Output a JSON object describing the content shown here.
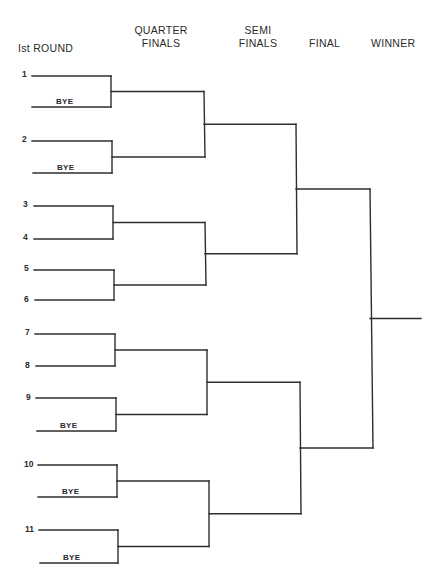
{
  "headers": {
    "round1": "Ist ROUND",
    "quarter_line1": "QUARTER",
    "quarter_line2": "FINALS",
    "semi_line1": "SEMI",
    "semi_line2": "FINALS",
    "final": "FINAL",
    "winner": "WINNER"
  },
  "first_round": [
    {
      "seed": "1",
      "y": 76,
      "x1": 32,
      "x2": 111
    },
    {
      "seed": "",
      "bye": "BYE",
      "y": 107,
      "x1": 32,
      "x2": 111
    },
    {
      "seed": "2",
      "y": 141,
      "x1": 32,
      "x2": 112
    },
    {
      "seed": "",
      "bye": "BYE",
      "y": 173,
      "x1": 33,
      "x2": 112
    },
    {
      "seed": "3",
      "y": 206,
      "x1": 34,
      "x2": 113
    },
    {
      "seed": "4",
      "y": 239,
      "x1": 34,
      "x2": 113
    },
    {
      "seed": "5",
      "y": 270,
      "x1": 34,
      "x2": 114
    },
    {
      "seed": "6",
      "y": 300,
      "x1": 35,
      "x2": 114
    },
    {
      "seed": "7",
      "y": 334,
      "x1": 35,
      "x2": 115
    },
    {
      "seed": "8",
      "y": 366,
      "x1": 36,
      "x2": 115
    },
    {
      "seed": "9",
      "y": 398,
      "x1": 36,
      "x2": 116
    },
    {
      "seed": "",
      "bye": "BYE",
      "y": 431,
      "x1": 37,
      "x2": 116
    },
    {
      "seed": "10",
      "y": 465,
      "x1": 38,
      "x2": 117
    },
    {
      "seed": "",
      "bye": "BYE",
      "y": 497,
      "x1": 38,
      "x2": 117
    },
    {
      "seed": "11",
      "y": 530,
      "x1": 39,
      "x2": 118
    },
    {
      "seed": "",
      "bye": "BYE",
      "y": 563,
      "x1": 40,
      "x2": 118
    }
  ],
  "quarter_finals": [
    {
      "y": 91,
      "x1": 111,
      "x2": 204,
      "top": 90,
      "bottom": 157
    },
    {
      "y": 156,
      "x1": 112,
      "x2": 205,
      "top": 222,
      "bottom": 285
    },
    {
      "y": 222,
      "x1": 113,
      "x2": 205,
      "top": 0,
      "bottom": 0
    },
    {
      "y": 286,
      "x1": 114,
      "x2": 206,
      "top": 0,
      "bottom": 0
    },
    {
      "y": 349,
      "x1": 115,
      "x2": 207,
      "top": 348,
      "bottom": 413
    },
    {
      "y": 414,
      "x1": 116,
      "x2": 207,
      "top": 478,
      "bottom": 543
    },
    {
      "y": 479,
      "x1": 117,
      "x2": 209,
      "top": 0,
      "bottom": 0
    },
    {
      "y": 544,
      "x1": 118,
      "x2": 209,
      "top": 0,
      "bottom": 0
    }
  ],
  "semi_finals": [
    {
      "y": 123,
      "x1": 204,
      "x2": 296
    },
    {
      "y": 253,
      "x1": 205,
      "x2": 297
    },
    {
      "y": 380,
      "x1": 207,
      "x2": 300
    },
    {
      "y": 509,
      "x1": 209,
      "x2": 301
    }
  ],
  "finals": [
    {
      "y": 192,
      "x1": 296,
      "x2": 370
    },
    {
      "y": 444,
      "x1": 300,
      "x2": 373
    }
  ],
  "winner": {
    "y": 314,
    "x1": 371,
    "x2": 421
  },
  "line_color": "#2e2e2e",
  "background": "#ffffff"
}
